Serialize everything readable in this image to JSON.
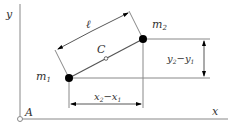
{
  "diagram": {
    "axes": {
      "x_label": "x",
      "y_label": "y",
      "origin_label": "A"
    },
    "masses": {
      "m1": "m",
      "m1_sub": "1",
      "m2": "m",
      "m2_sub": "2"
    },
    "center_label": "C",
    "length_label": "ℓ",
    "dx_label": {
      "a": "x",
      "a_sub": "2",
      "minus": "−",
      "b": "x",
      "b_sub": "1"
    },
    "dy_label": {
      "a": "y",
      "a_sub": "2",
      "minus": "−",
      "b": "y",
      "b_sub": "1"
    },
    "colors": {
      "line": "#666666",
      "dot": "#000000",
      "text": "#333333"
    }
  }
}
